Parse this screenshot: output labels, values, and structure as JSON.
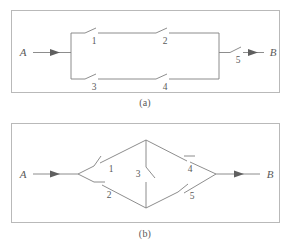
{
  "figure": {
    "background_color": "#ffffff",
    "line_color": "#808080",
    "text_color": "#5a5a5a",
    "border_color": "#b9b9b9",
    "arrow_color": "#5f5f5f"
  },
  "panels": [
    {
      "id": "a",
      "caption": "(a)",
      "topology": "series-parallel",
      "terminal_in": "A",
      "terminal_out": "B",
      "switches": [
        {
          "label": "1",
          "branch": "upper",
          "position": "left"
        },
        {
          "label": "2",
          "branch": "upper",
          "position": "right"
        },
        {
          "label": "3",
          "branch": "lower",
          "position": "left"
        },
        {
          "label": "4",
          "branch": "lower",
          "position": "right"
        },
        {
          "label": "5",
          "branch": "output",
          "position": "right"
        }
      ]
    },
    {
      "id": "b",
      "caption": "(b)",
      "topology": "bridge",
      "terminal_in": "A",
      "terminal_out": "B",
      "switches": [
        {
          "label": "1",
          "branch": "upper-left",
          "position": "left"
        },
        {
          "label": "2",
          "branch": "lower-left",
          "position": "left"
        },
        {
          "label": "3",
          "branch": "bridge-vertical",
          "position": "center"
        },
        {
          "label": "4",
          "branch": "upper-right",
          "position": "right"
        },
        {
          "label": "5",
          "branch": "lower-right",
          "position": "right"
        }
      ]
    }
  ],
  "labels": {
    "a": {
      "A": "A",
      "B": "B",
      "s1": "1",
      "s2": "2",
      "s3": "3",
      "s4": "4",
      "s5": "5",
      "caption": "(a)"
    },
    "b": {
      "A": "A",
      "B": "B",
      "s1": "1",
      "s2": "2",
      "s3": "3",
      "s4": "4",
      "s5": "5",
      "caption": "(b)"
    }
  }
}
